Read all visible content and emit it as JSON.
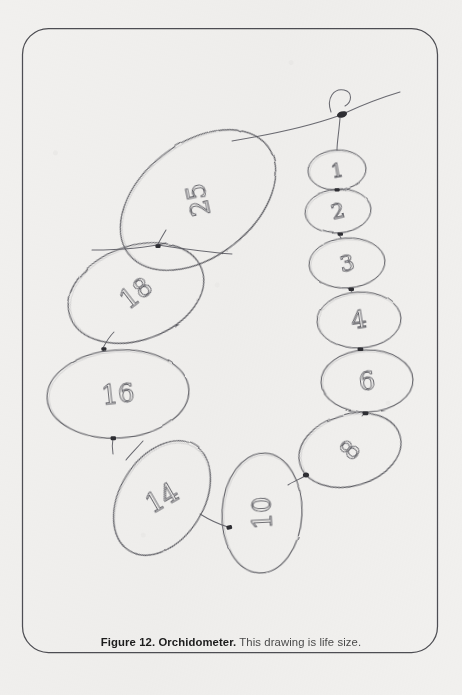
{
  "page": {
    "background_color": "#f1f0ee",
    "border_color": "#4b4b50",
    "ink_color": "#5a5a60"
  },
  "caption": {
    "figure_label": "Figure 12. Orchidometer.",
    "description": "This drawing is life size."
  },
  "figure": {
    "title": "Orchidometer",
    "note": "hand-drawn chain of numbered ovoid beads strung on a cord",
    "bead_count": 11,
    "beads": [
      {
        "label": "1",
        "cx": 337,
        "cy": 170,
        "rx": 29,
        "ry": 20,
        "rotation": -4,
        "label_rotation": -6
      },
      {
        "label": "2",
        "cx": 338,
        "cy": 211,
        "rx": 33,
        "ry": 22,
        "rotation": -5,
        "label_rotation": -8
      },
      {
        "label": "3",
        "cx": 347,
        "cy": 263,
        "rx": 38,
        "ry": 25,
        "rotation": -4,
        "label_rotation": -8
      },
      {
        "label": "4",
        "cx": 359,
        "cy": 320,
        "rx": 42,
        "ry": 28,
        "rotation": -3,
        "label_rotation": -6
      },
      {
        "label": "6",
        "cx": 367,
        "cy": 381,
        "rx": 46,
        "ry": 31,
        "rotation": -2,
        "label_rotation": -5
      },
      {
        "label": "8",
        "cx": 350,
        "cy": 450,
        "rx": 52,
        "ry": 36,
        "rotation": -16,
        "label_rotation": -34
      },
      {
        "label": "10",
        "cx": 262,
        "cy": 513,
        "rx": 40,
        "ry": 60,
        "rotation": 3,
        "label_rotation": -96
      },
      {
        "label": "14",
        "cx": 162,
        "cy": 498,
        "rx": 42,
        "ry": 62,
        "rotation": 32,
        "label_rotation": -62
      },
      {
        "label": "16",
        "cx": 118,
        "cy": 394,
        "rx": 71,
        "ry": 44,
        "rotation": -4,
        "label_rotation": -2
      },
      {
        "label": "18",
        "cx": 136,
        "cy": 293,
        "rx": 70,
        "ry": 47,
        "rotation": -20,
        "label_rotation": -18
      },
      {
        "label": "25",
        "cx": 198,
        "cy": 200,
        "rx": 88,
        "ry": 57,
        "rotation": -38,
        "label_rotation": -64
      }
    ],
    "cord": {
      "knot_x": 342,
      "knot_y": 114,
      "has_top_loop": true
    }
  }
}
